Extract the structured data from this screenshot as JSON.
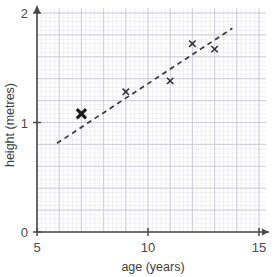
{
  "chart_data": {
    "type": "scatter",
    "title": "",
    "xlabel": "age (years)",
    "ylabel": "height (metres)",
    "xlim": [
      5,
      15
    ],
    "ylim": [
      0,
      2
    ],
    "xticks": [
      5,
      10,
      15
    ],
    "yticks": [
      0,
      1,
      2
    ],
    "xtick_labels": [
      "5",
      "10",
      "15"
    ],
    "ytick_labels": [
      "0",
      "1",
      "2"
    ],
    "grid": true,
    "grid_major_x_step": 1,
    "grid_major_y_step": 0.2,
    "grid_minor_x_step": 0.2,
    "grid_minor_y_step": 0.04,
    "legend": null,
    "points": [
      {
        "age": 7,
        "height": 1.08,
        "style": "bold"
      },
      {
        "age": 9,
        "height": 1.28,
        "style": "normal"
      },
      {
        "age": 11,
        "height": 1.38,
        "style": "normal"
      },
      {
        "age": 12,
        "height": 1.72,
        "style": "normal"
      },
      {
        "age": 13,
        "height": 1.67,
        "style": "normal"
      }
    ],
    "trend_line": {
      "style": "dashed",
      "x_start": 5.9,
      "y_start": 0.81,
      "x_end": 13.8,
      "y_end": 1.86
    },
    "colors": {
      "marker": "#2e2e2e",
      "marker_bold": "#1a1a1a",
      "trend": "#3a3a3a",
      "axis": "#4a4a4a",
      "grid_minor": "#e9e9ef",
      "grid_major": "#c9c9d2",
      "background": "#ffffff"
    }
  },
  "axes": {
    "x_title": "age (years)",
    "y_title": "height (metres)",
    "x_labels": [
      "5",
      "10",
      "15"
    ],
    "y_labels": [
      "0",
      "1",
      "2"
    ]
  }
}
